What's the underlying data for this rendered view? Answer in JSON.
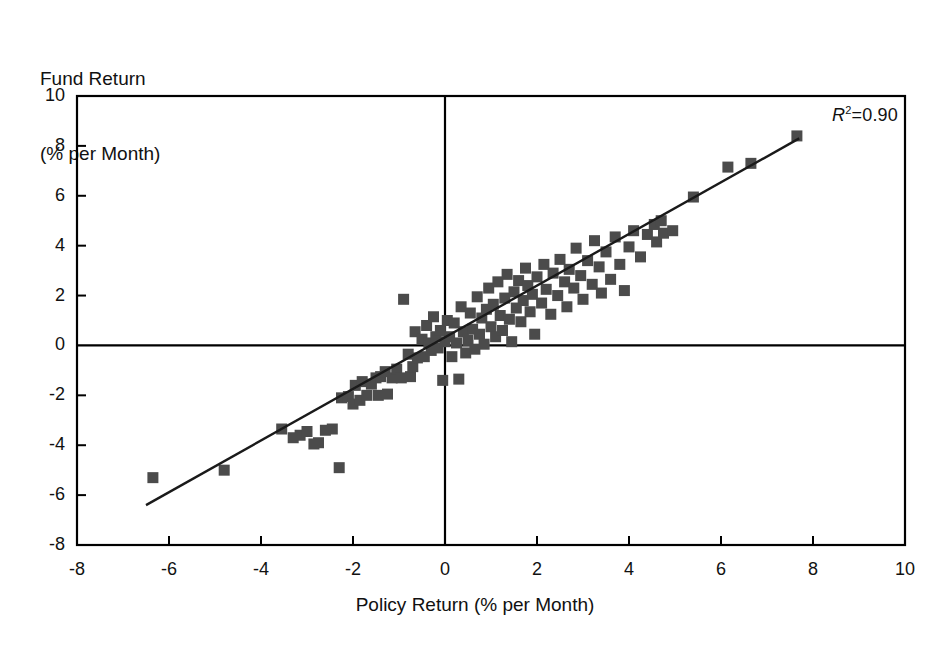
{
  "chart_data": {
    "type": "scatter",
    "title": "",
    "ylabel": "Fund Return\n(% per Month)",
    "ylabel_line1": "Fund Return",
    "ylabel_line2": "(% per Month)",
    "xlabel": "Policy Return (% per Month)",
    "xlim": [
      -8,
      10
    ],
    "ylim": [
      -8,
      10
    ],
    "xticks": [
      -8,
      -6,
      -4,
      -2,
      0,
      2,
      4,
      6,
      8,
      10
    ],
    "yticks": [
      -8,
      -6,
      -4,
      -2,
      0,
      2,
      4,
      6,
      8,
      10
    ],
    "xtick_labels": [
      "-8",
      "-6",
      "-4",
      "-2",
      "0",
      "2",
      "4",
      "6",
      "8",
      "10"
    ],
    "ytick_labels": [
      "-8",
      "-6",
      "-4",
      "-2",
      "0",
      "2",
      "4",
      "6",
      "8",
      "10"
    ],
    "grid": false,
    "legend": null,
    "annotations": [
      {
        "name": "r-squared",
        "prefix": "R",
        "superscript": "2",
        "text": "=0.90",
        "full_text": "R2=0.90",
        "value": 0.9,
        "position": "top-right"
      }
    ],
    "marker": {
      "shape": "square",
      "color": "#4b4b4b",
      "size_px": 11
    },
    "trendline": {
      "type": "linear-fit",
      "color": "#1a1a1a",
      "x_start": -6.5,
      "y_start": -6.4,
      "x_end": 7.7,
      "y_end": 8.3,
      "slope": 1.035,
      "intercept": 0.33
    },
    "zero_lines": {
      "vertical_x": 0,
      "horizontal_y": 0,
      "color": "#000000"
    },
    "points": [
      [
        -6.35,
        -5.3
      ],
      [
        -4.8,
        -5.0
      ],
      [
        -3.55,
        -3.35
      ],
      [
        -3.3,
        -3.7
      ],
      [
        -3.15,
        -3.6
      ],
      [
        -3.0,
        -3.45
      ],
      [
        -2.85,
        -3.95
      ],
      [
        -2.75,
        -3.9
      ],
      [
        -2.6,
        -3.4
      ],
      [
        -2.45,
        -3.35
      ],
      [
        -2.3,
        -4.9
      ],
      [
        -2.25,
        -2.1
      ],
      [
        -2.1,
        -2.05
      ],
      [
        -2.0,
        -2.35
      ],
      [
        -1.95,
        -1.6
      ],
      [
        -1.85,
        -2.2
      ],
      [
        -1.8,
        -1.45
      ],
      [
        -1.7,
        -2.0
      ],
      [
        -1.6,
        -1.55
      ],
      [
        -1.5,
        -1.3
      ],
      [
        -1.45,
        -2.0
      ],
      [
        -1.4,
        -1.25
      ],
      [
        -1.3,
        -1.05
      ],
      [
        -1.25,
        -1.95
      ],
      [
        -1.15,
        -1.3
      ],
      [
        -1.05,
        -0.95
      ],
      [
        -0.95,
        -1.3
      ],
      [
        -0.9,
        1.85
      ],
      [
        -0.8,
        -0.35
      ],
      [
        -0.75,
        -1.25
      ],
      [
        -0.7,
        -0.85
      ],
      [
        -0.65,
        0.55
      ],
      [
        -0.6,
        -0.5
      ],
      [
        -0.5,
        0.25
      ],
      [
        -0.45,
        -0.45
      ],
      [
        -0.4,
        0.8
      ],
      [
        -0.35,
        0.1
      ],
      [
        -0.3,
        -0.2
      ],
      [
        -0.25,
        1.15
      ],
      [
        -0.2,
        0.35
      ],
      [
        -0.15,
        -0.1
      ],
      [
        -0.1,
        0.6
      ],
      [
        -0.05,
        -1.4
      ],
      [
        0.0,
        0.15
      ],
      [
        0.05,
        1.0
      ],
      [
        0.1,
        0.35
      ],
      [
        0.15,
        -0.45
      ],
      [
        0.2,
        0.9
      ],
      [
        0.25,
        0.1
      ],
      [
        0.3,
        -1.35
      ],
      [
        0.35,
        1.55
      ],
      [
        0.4,
        0.55
      ],
      [
        0.45,
        -0.3
      ],
      [
        0.5,
        0.2
      ],
      [
        0.55,
        1.3
      ],
      [
        0.6,
        0.65
      ],
      [
        0.65,
        -0.15
      ],
      [
        0.7,
        1.95
      ],
      [
        0.75,
        0.45
      ],
      [
        0.8,
        1.1
      ],
      [
        0.85,
        0.05
      ],
      [
        0.9,
        1.45
      ],
      [
        0.95,
        2.3
      ],
      [
        1.0,
        0.75
      ],
      [
        1.05,
        1.65
      ],
      [
        1.1,
        0.35
      ],
      [
        1.15,
        2.55
      ],
      [
        1.2,
        1.2
      ],
      [
        1.25,
        0.6
      ],
      [
        1.3,
        1.9
      ],
      [
        1.35,
        2.85
      ],
      [
        1.4,
        1.05
      ],
      [
        1.45,
        0.15
      ],
      [
        1.5,
        2.15
      ],
      [
        1.55,
        1.5
      ],
      [
        1.6,
        2.6
      ],
      [
        1.65,
        0.95
      ],
      [
        1.7,
        1.8
      ],
      [
        1.75,
        3.1
      ],
      [
        1.8,
        2.4
      ],
      [
        1.85,
        1.35
      ],
      [
        1.9,
        2.05
      ],
      [
        1.95,
        0.45
      ],
      [
        2.0,
        2.75
      ],
      [
        2.1,
        1.7
      ],
      [
        2.15,
        3.25
      ],
      [
        2.2,
        2.25
      ],
      [
        2.3,
        1.25
      ],
      [
        2.35,
        2.9
      ],
      [
        2.45,
        2.0
      ],
      [
        2.5,
        3.45
      ],
      [
        2.6,
        2.55
      ],
      [
        2.65,
        1.55
      ],
      [
        2.7,
        3.05
      ],
      [
        2.8,
        2.3
      ],
      [
        2.85,
        3.9
      ],
      [
        2.95,
        2.8
      ],
      [
        3.0,
        1.85
      ],
      [
        3.1,
        3.4
      ],
      [
        3.2,
        2.45
      ],
      [
        3.25,
        4.2
      ],
      [
        3.35,
        3.15
      ],
      [
        3.4,
        2.1
      ],
      [
        3.5,
        3.75
      ],
      [
        3.6,
        2.65
      ],
      [
        3.7,
        4.35
      ],
      [
        3.8,
        3.25
      ],
      [
        3.9,
        2.2
      ],
      [
        4.0,
        3.95
      ],
      [
        4.1,
        4.6
      ],
      [
        4.25,
        3.55
      ],
      [
        4.4,
        4.45
      ],
      [
        4.55,
        4.85
      ],
      [
        4.6,
        4.15
      ],
      [
        4.7,
        5.0
      ],
      [
        4.75,
        4.5
      ],
      [
        4.95,
        4.6
      ],
      [
        5.4,
        5.95
      ],
      [
        6.15,
        7.15
      ],
      [
        6.65,
        7.3
      ],
      [
        7.65,
        8.4
      ]
    ]
  }
}
